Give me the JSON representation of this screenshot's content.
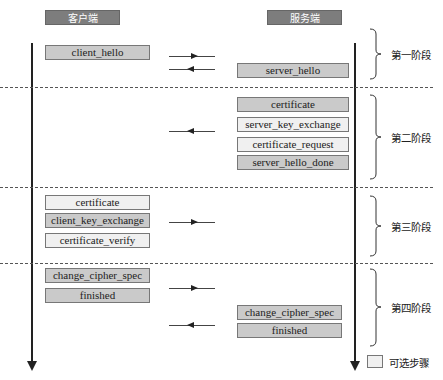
{
  "headers": {
    "client": "客户端",
    "server": "服务端"
  },
  "colors": {
    "header_bg": "#7d7d7d",
    "required_bg": "#cacaca",
    "optional_bg": "#f0f0f0",
    "line": "#222222"
  },
  "phases": [
    {
      "label": "第一阶段",
      "client_messages": [
        {
          "label": "client_hello",
          "optional": false
        }
      ],
      "server_messages": [
        {
          "label": "server_hello",
          "optional": false
        }
      ],
      "arrows": [
        "right",
        "left"
      ]
    },
    {
      "label": "第二阶段",
      "client_messages": [],
      "server_messages": [
        {
          "label": "certificate",
          "optional": false
        },
        {
          "label": "server_key_exchange",
          "optional": true
        },
        {
          "label": "certificate_request",
          "optional": true
        },
        {
          "label": "server_hello_done",
          "optional": false
        }
      ],
      "arrows": [
        "left"
      ]
    },
    {
      "label": "第三阶段",
      "client_messages": [
        {
          "label": "certificate",
          "optional": true
        },
        {
          "label": "client_key_exchange",
          "optional": false
        },
        {
          "label": "certificate_verify",
          "optional": true
        }
      ],
      "server_messages": [],
      "arrows": [
        "right"
      ]
    },
    {
      "label": "第四阶段",
      "client_messages": [
        {
          "label": "change_cipher_spec",
          "optional": false
        },
        {
          "label": "finished",
          "optional": false
        }
      ],
      "server_messages": [
        {
          "label": "change_cipher_spec",
          "optional": false
        },
        {
          "label": "finished",
          "optional": false
        }
      ],
      "arrows": [
        "right",
        "left"
      ]
    }
  ],
  "legend": {
    "label": "可选步骤"
  }
}
